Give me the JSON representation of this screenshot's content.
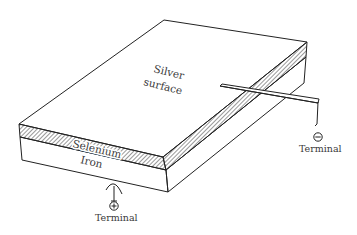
{
  "diagram": {
    "labels": {
      "silver_line1": "Silver",
      "silver_line2": "surface",
      "selenium": "Selenium",
      "iron": "Iron",
      "terminal_negative": "Terminal",
      "terminal_positive": "Terminal",
      "negative_symbol": "−",
      "positive_symbol": "+"
    },
    "layers": [
      {
        "name": "Silver surface",
        "role": "top"
      },
      {
        "name": "Selenium",
        "role": "middle",
        "pattern": "hatched"
      },
      {
        "name": "Iron",
        "role": "bottom"
      }
    ],
    "colors": {
      "line": "#222222",
      "text": "#3a3a3a",
      "background": "#ffffff",
      "hatch": "#444444"
    }
  }
}
